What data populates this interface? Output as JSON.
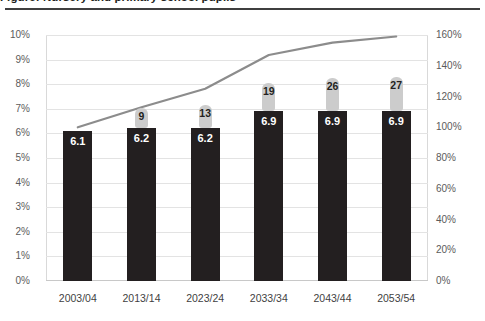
{
  "title": "Figure: Nursery and primary school pupils",
  "axes": {
    "left_ticks": [
      "10%",
      "9%",
      "8%",
      "7%",
      "6%",
      "5%",
      "4%",
      "3%",
      "2%",
      "1%",
      "0%"
    ],
    "right_ticks": [
      "160%",
      "140%",
      "120%",
      "100%",
      "80%",
      "60%",
      "40%",
      "20%",
      "0%"
    ]
  },
  "chart_data": {
    "type": "bar",
    "title": "Figure: Nursery and primary school pupils",
    "xlabel": "",
    "ylabel": "",
    "categories": [
      "2003/04",
      "2013/14",
      "2023/24",
      "2033/34",
      "2043/44",
      "2053/54"
    ],
    "series": [
      {
        "name": "Spending (% of GDP)",
        "axis": "left",
        "type": "bar",
        "color": "#231f20",
        "values": [
          6.1,
          6.2,
          6.2,
          6.9,
          6.9,
          6.9
        ],
        "labels": [
          "6.1",
          "6.2",
          "6.2",
          "6.9",
          "6.9",
          "6.9"
        ]
      },
      {
        "name": "Additional amount",
        "axis": "left",
        "type": "bar",
        "color": "#cccccc",
        "values": [
          null,
          9,
          13,
          19,
          26,
          27
        ],
        "labels": [
          "",
          "9",
          "13",
          "19",
          "26",
          "27"
        ]
      },
      {
        "name": "Index",
        "axis": "right",
        "type": "line",
        "color": "#8c8c8c",
        "values": [
          100,
          113,
          125,
          147,
          155,
          159
        ]
      }
    ],
    "ylim": [
      0,
      10
    ],
    "y2lim": [
      0,
      160
    ],
    "grid": true,
    "legend": "none"
  }
}
